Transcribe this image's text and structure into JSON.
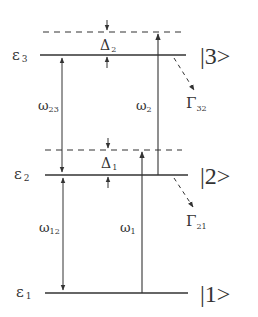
{
  "diagram": {
    "type": "three-level energy diagram",
    "levels": [
      {
        "id": "e3",
        "energy_label": "ε",
        "energy_sub": "3",
        "ket_label": "|3>"
      },
      {
        "id": "e2",
        "energy_label": "ε",
        "energy_sub": "2",
        "ket_label": "|2>"
      },
      {
        "id": "e1",
        "energy_label": "ε",
        "energy_sub": "1",
        "ket_label": "|1>"
      }
    ],
    "detunings": [
      {
        "id": "delta2",
        "symbol": "Δ",
        "sub": "2"
      },
      {
        "id": "delta1",
        "symbol": "Δ",
        "sub": "1"
      }
    ],
    "transitions": [
      {
        "id": "omega23",
        "symbol": "ω",
        "sub": "23"
      },
      {
        "id": "omega12",
        "symbol": "ω",
        "sub": "12"
      },
      {
        "id": "omega2",
        "symbol": "ω",
        "sub": "2"
      },
      {
        "id": "omega1",
        "symbol": "ω",
        "sub": "1"
      }
    ],
    "decays": [
      {
        "id": "gamma32",
        "symbol": "Γ",
        "sub": "32"
      },
      {
        "id": "gamma21",
        "symbol": "Γ",
        "sub": "21"
      }
    ],
    "colors": {
      "line": "#333333",
      "background": "#ffffff"
    }
  }
}
